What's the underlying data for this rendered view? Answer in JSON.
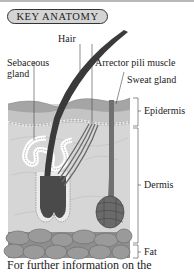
{
  "header": {
    "title": "KEY ANATOMY"
  },
  "diagram": {
    "labels": {
      "hair": "Hair",
      "sebaceous_gland": "Sebaceous\ngland",
      "sebaceous_line1": "Sebaceous",
      "sebaceous_line2": "gland",
      "arrector_pili_muscle": "Arrector pili muscle",
      "sweat_gland": "Sweat gland",
      "epidermis": "Epidermis",
      "dermis": "Dermis",
      "fat": "Fat"
    },
    "colors": {
      "epidermis_top": "#a9a9a9",
      "epidermis_base": "#c4c4c4",
      "dermis": "#d6d6d6",
      "fat": "#8e8e8e",
      "hair": "#3a3a3a",
      "sweat_gland": "#6a6a6a"
    }
  },
  "footer": {
    "text": "For further information on the"
  }
}
